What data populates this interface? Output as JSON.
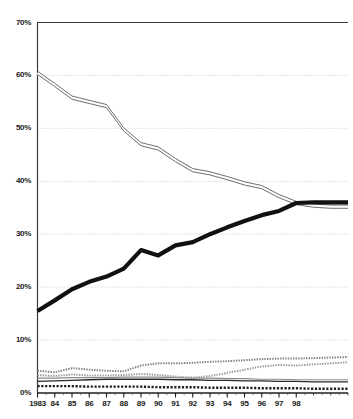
{
  "chart_data": {
    "type": "line",
    "title": "",
    "subtitle": "",
    "xlabel": "",
    "ylabel": "",
    "xlim": [
      1983,
      2001
    ],
    "ylim": [
      0,
      70
    ],
    "grid": true,
    "legend": "none",
    "y_tick_labels": [
      "70%",
      "60%",
      "50%",
      "40%",
      "30%",
      "20%",
      "10%",
      "0%"
    ],
    "y_tick_values": [
      70,
      60,
      50,
      40,
      30,
      20,
      10,
      0
    ],
    "x_tick_labels": [
      "1983",
      "84",
      "85",
      "86",
      "87",
      "88",
      "89",
      "90",
      "91",
      "92",
      "93",
      "94",
      "95",
      "96",
      "97",
      "98"
    ],
    "x": [
      1983,
      1984,
      1985,
      1986,
      1987,
      1988,
      1989,
      1990,
      1991,
      1992,
      1993,
      1994,
      1995,
      1996,
      1997,
      1998,
      1999,
      2000,
      2001
    ],
    "series": [
      {
        "name": "declining-series",
        "style": "outline-gray",
        "color": "#6e6e6e",
        "values": [
          60.5,
          58.2,
          55.8,
          55.0,
          54.2,
          49.8,
          47.0,
          46.2,
          44.0,
          42.1,
          41.5,
          40.6,
          39.6,
          38.9,
          37.2,
          35.9,
          35.4,
          35.2,
          35.2
        ]
      },
      {
        "name": "rising-series",
        "style": "solid-black",
        "color": "#111111",
        "values": [
          15.5,
          17.5,
          19.6,
          21.0,
          22.0,
          23.5,
          27.0,
          26.0,
          27.9,
          28.5,
          30.0,
          31.3,
          32.5,
          33.6,
          34.4,
          35.9,
          36.0,
          36.0,
          36.0
        ]
      },
      {
        "name": "low-series-dotted-upper",
        "style": "dotted-gray",
        "color": "#808080",
        "values": [
          4.2,
          3.9,
          4.7,
          4.4,
          4.2,
          4.1,
          5.2,
          5.6,
          5.6,
          5.7,
          5.9,
          6.0,
          6.2,
          6.4,
          6.5,
          6.5,
          6.6,
          6.7,
          6.8
        ]
      },
      {
        "name": "low-series-dotted-lower",
        "style": "dotted-gray",
        "color": "#9a9a9a",
        "values": [
          3.4,
          3.2,
          3.5,
          3.3,
          3.3,
          3.4,
          3.6,
          3.4,
          3.1,
          2.9,
          3.2,
          3.8,
          4.4,
          5.0,
          5.3,
          5.2,
          5.4,
          5.6,
          5.8
        ]
      },
      {
        "name": "low-series-flat-gray",
        "style": "thin-gray",
        "color": "#8a8a8a",
        "values": [
          2.8,
          2.8,
          2.9,
          2.9,
          2.9,
          3.0,
          3.0,
          3.0,
          2.9,
          2.8,
          2.8,
          2.7,
          2.7,
          2.6,
          2.6,
          2.5,
          2.5,
          2.5,
          2.5
        ]
      },
      {
        "name": "low-series-flat-black",
        "style": "thin-black",
        "color": "#2a2a2a",
        "values": [
          2.2,
          2.3,
          2.4,
          2.5,
          2.6,
          2.6,
          2.6,
          2.6,
          2.5,
          2.5,
          2.4,
          2.4,
          2.3,
          2.3,
          2.2,
          2.2,
          2.1,
          2.1,
          2.1
        ]
      },
      {
        "name": "low-series-bottom",
        "style": "dashed-black",
        "color": "#1f1f1f",
        "values": [
          1.3,
          1.3,
          1.3,
          1.2,
          1.2,
          1.2,
          1.2,
          1.1,
          1.1,
          1.1,
          1.0,
          1.0,
          1.0,
          0.9,
          0.9,
          0.9,
          0.8,
          0.8,
          0.8
        ]
      }
    ]
  }
}
